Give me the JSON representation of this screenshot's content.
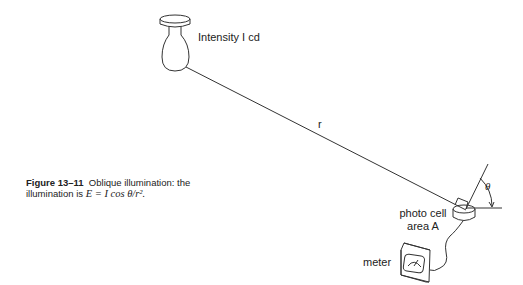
{
  "figure": {
    "number_label": "Figure 13–11",
    "caption_text": "Oblique illumination: the illumination is",
    "caption_line1": "Oblique illumination: the",
    "caption_line2_prefix": "illumination is",
    "formula": "E = I cos θ/r²."
  },
  "labels": {
    "source": "Intensity I cd",
    "distance": "r",
    "angle": "θ",
    "photocell_line1": "photo cell",
    "photocell_line2": "area A",
    "meter": "meter"
  },
  "colors": {
    "line": "#333333",
    "background": "#ffffff"
  }
}
